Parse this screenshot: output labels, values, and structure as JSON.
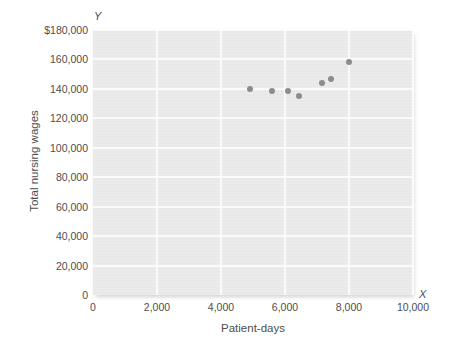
{
  "chart_data": {
    "type": "scatter",
    "title": "",
    "xlabel": "Patient-days",
    "ylabel": "Total nursing wages",
    "axis_letter_x": "X",
    "axis_letter_y": "Y",
    "xlim": [
      0,
      10000
    ],
    "ylim": [
      0,
      180000
    ],
    "grid": true,
    "legend": "none",
    "xticks": [
      {
        "value": 0,
        "label": "0"
      },
      {
        "value": 2000,
        "label": "2,000"
      },
      {
        "value": 4000,
        "label": "4,000"
      },
      {
        "value": 6000,
        "label": "6,000"
      },
      {
        "value": 8000,
        "label": "8,000"
      },
      {
        "value": 10000,
        "label": "10,000"
      }
    ],
    "yticks": [
      {
        "value": 0,
        "label": "0"
      },
      {
        "value": 20000,
        "label": "20,000"
      },
      {
        "value": 40000,
        "label": "40,000"
      },
      {
        "value": 60000,
        "label": "60,000"
      },
      {
        "value": 80000,
        "label": "80,000"
      },
      {
        "value": 100000,
        "label": "100,000"
      },
      {
        "value": 120000,
        "label": "120,000"
      },
      {
        "value": 140000,
        "label": "140,000"
      },
      {
        "value": 160000,
        "label": "160,000"
      },
      {
        "value": 180000,
        "label": "$180,000"
      }
    ],
    "series": [
      {
        "name": "Nursing wages vs patient-days",
        "marker_color": "#8c8c8c",
        "points": [
          {
            "x": 4900,
            "y": 140000
          },
          {
            "x": 5600,
            "y": 138500
          },
          {
            "x": 6100,
            "y": 138500
          },
          {
            "x": 6450,
            "y": 135500
          },
          {
            "x": 7150,
            "y": 144000
          },
          {
            "x": 7450,
            "y": 147000
          },
          {
            "x": 8000,
            "y": 158500
          }
        ]
      }
    ],
    "colors": {
      "plot_background": "#e9e9e9",
      "gridline": "#fbfbfb",
      "text": "#4d4d4d",
      "marker": "#8c8c8c",
      "page_background": "#ffffff"
    }
  }
}
